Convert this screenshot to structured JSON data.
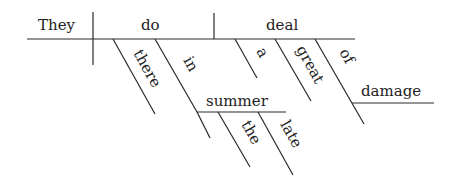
{
  "diagram": {
    "type": "Reed-Kellogg sentence diagram",
    "sentence_words": [
      "They",
      "do",
      "there",
      "in",
      "the",
      "late",
      "summer",
      "a",
      "great",
      "deal",
      "of",
      "damage"
    ],
    "subject": "They",
    "verb": "do",
    "object": "deal",
    "modifiers": {
      "verb_adverb": "there",
      "verb_preposition": "in",
      "preposition_object": "summer",
      "summer_modifiers": [
        "the",
        "late"
      ],
      "object_modifiers": [
        "a",
        "great"
      ],
      "object_preposition": "of",
      "object_preposition_object": "damage"
    },
    "colors": {
      "line": "#2a2a2a",
      "text": "#222222",
      "background": "#ffffff"
    }
  }
}
